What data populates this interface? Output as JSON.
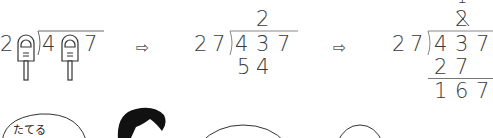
{
  "panel1": {
    "divisor_last": "2",
    "dividend_digits": [
      "4",
      "7"
    ],
    "placeholder_icon": "finger-cover-icon"
  },
  "arrows": [
    "⇨",
    "⇨"
  ],
  "panel2": {
    "divisor": [
      "2",
      "7"
    ],
    "dividend": [
      "4",
      "3",
      "7"
    ],
    "quotient": "2",
    "product": [
      "5",
      "4"
    ]
  },
  "panel3": {
    "divisor": [
      "2",
      "7"
    ],
    "dividend": [
      "4",
      "3",
      "7"
    ],
    "quotient_crossed": "2",
    "quotient_new": "1",
    "product": [
      "2",
      "7"
    ],
    "remainder": [
      "1",
      "6",
      "7"
    ]
  },
  "bubbles": [
    {
      "label": "たてる"
    },
    {
      "label": ""
    },
    {
      "label": ""
    }
  ]
}
